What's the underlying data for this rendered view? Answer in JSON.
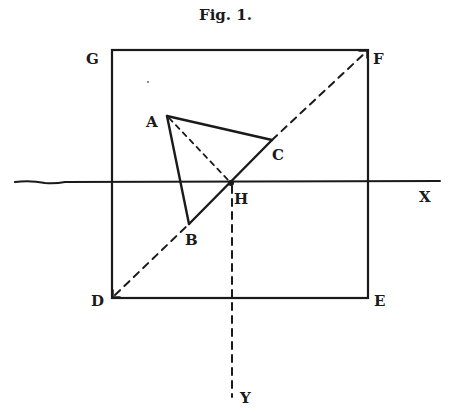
{
  "figure": {
    "title": "Fig. 1.",
    "labels": {
      "A": "A",
      "B": "B",
      "C": "C",
      "D": "D",
      "E": "E",
      "F": "F",
      "G": "G",
      "H": "H",
      "X": "X",
      "Y": "Y"
    },
    "points": {
      "G": [
        112,
        50
      ],
      "F": [
        368,
        50
      ],
      "D": [
        112,
        298
      ],
      "E": [
        368,
        298
      ],
      "A": [
        167,
        116
      ],
      "B": [
        189,
        224
      ],
      "C": [
        272,
        140
      ],
      "H": [
        231,
        183
      ]
    },
    "lines": {
      "square": "G-F-E-D solid",
      "diagonal": "D-F dashed, solid between B and C",
      "triangle": "A-B-C solid",
      "A_to_H": "dashed",
      "x_axis": "horizontal solid through H to X",
      "y_axis": "vertical dashed from H down to Y"
    },
    "colors": {
      "ink": "#1a1a1a",
      "paper": "#ffffff"
    }
  }
}
